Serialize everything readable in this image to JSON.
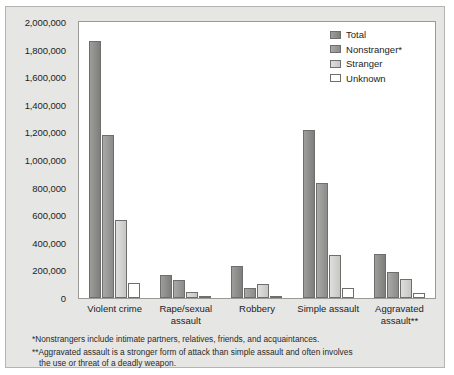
{
  "chart_data": {
    "type": "bar",
    "title": "",
    "xlabel": "",
    "ylabel": "",
    "ylim": [
      0,
      2000000
    ],
    "grid": false,
    "legend_position": "top-right",
    "categories": [
      "Violent crime",
      "Rape/sexual assault",
      "Robbery",
      "Simple assault",
      "Aggravated assault**"
    ],
    "ytick_labels": [
      "2,000,000",
      "1,800,000",
      "1,600,000",
      "1,400,000",
      "1,200,000",
      "1,000,000",
      "800,000",
      "600,000",
      "400,000",
      "200,000",
      "0"
    ],
    "ytick_values": [
      2000000,
      1800000,
      1600000,
      1400000,
      1200000,
      1000000,
      800000,
      600000,
      400000,
      200000,
      0
    ],
    "series": [
      {
        "name": "Total",
        "color": "#8c8c8a",
        "values": [
          1860000,
          170000,
          230000,
          1215000,
          320000
        ]
      },
      {
        "name": "Nonstranger*",
        "color": "#999997",
        "values": [
          1180000,
          130000,
          75000,
          830000,
          185000
        ]
      },
      {
        "name": "Stranger",
        "color": "#d2d2d0",
        "values": [
          565000,
          42000,
          100000,
          315000,
          140000
        ]
      },
      {
        "name": "Unknown",
        "color": "#747472",
        "values": [
          110000,
          8000,
          6000,
          75000,
          35000
        ]
      }
    ]
  },
  "legend": {
    "items": [
      {
        "label": "Total"
      },
      {
        "label": "Nonstranger*"
      },
      {
        "label": "Stranger"
      },
      {
        "label": "Unknown"
      }
    ]
  },
  "footnotes": {
    "note1": "*Nonstrangers include intimate partners, relatives, friends, and acquaintances.",
    "note2_line1": "**Aggravated assault is a stronger form of attack than simple assault and often involves",
    "note2_line2": "the use or threat of a deadly weapon."
  }
}
